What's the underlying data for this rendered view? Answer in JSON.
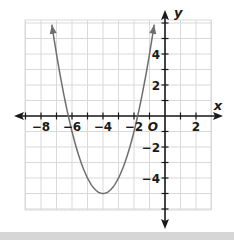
{
  "chart_data": {
    "type": "line",
    "title": "",
    "xlabel": "x",
    "ylabel": "y",
    "origin_label": "O",
    "xlim": [
      -9,
      3
    ],
    "ylim": [
      -6,
      6
    ],
    "grid": true,
    "grid_step": 1,
    "x_tick_labels": [
      {
        "value": -8,
        "label": "−8"
      },
      {
        "value": -6,
        "label": "−6"
      },
      {
        "value": -4,
        "label": "−4"
      },
      {
        "value": -2,
        "label": "−2"
      },
      {
        "value": 2,
        "label": "2"
      }
    ],
    "y_tick_labels": [
      {
        "value": 4,
        "label": "4"
      },
      {
        "value": 2,
        "label": "2"
      },
      {
        "value": -2,
        "label": "−2"
      },
      {
        "value": -4,
        "label": "−4"
      }
    ],
    "series": [
      {
        "name": "parabola",
        "equation": "y = (x + 4)^2 - 5",
        "vertex": [
          -4,
          -5
        ],
        "x_intercepts": [
          -6.24,
          -1.76
        ],
        "x_range": [
          -7.3,
          -0.7
        ],
        "arrows_at_ends": true,
        "color": "#6e6e6e"
      }
    ]
  },
  "colors": {
    "grid": "#d9d9d9",
    "axis": "#1a1a1a",
    "curve": "#6e6e6e",
    "label": "#1a1a1a"
  }
}
